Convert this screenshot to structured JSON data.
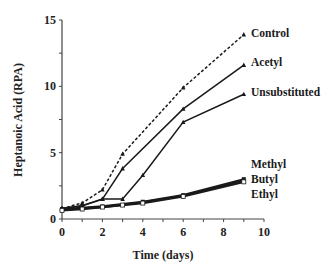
{
  "chart_data": {
    "type": "line",
    "title": "",
    "xlabel": "Time  (days)",
    "ylabel": "Heptanoic Acid (RPA)",
    "xlim": [
      0,
      10
    ],
    "ylim": [
      0,
      15
    ],
    "xticks": [
      0,
      2,
      4,
      6,
      8,
      10
    ],
    "yticks": [
      0,
      5,
      10,
      15
    ],
    "grid": false,
    "legend": "direct labels at line ends (right)",
    "series": [
      {
        "name": "Control",
        "style": "dashed",
        "marker": "triangle",
        "x": [
          0,
          1,
          2,
          3,
          6,
          9
        ],
        "y": [
          0.8,
          1.2,
          2.2,
          4.9,
          9.9,
          13.9
        ]
      },
      {
        "name": "Acetyl",
        "style": "solid",
        "marker": "triangle",
        "x": [
          0,
          1,
          2,
          3,
          6,
          9
        ],
        "y": [
          0.8,
          1.0,
          1.5,
          3.8,
          8.3,
          11.6
        ]
      },
      {
        "name": "Unsubstituted",
        "style": "solid",
        "marker": "triangle",
        "x": [
          0,
          1,
          2,
          3,
          4,
          6,
          9
        ],
        "y": [
          0.8,
          1.0,
          1.5,
          1.5,
          3.3,
          7.3,
          9.4
        ]
      },
      {
        "name": "Methyl",
        "style": "solid",
        "marker": "square",
        "x": [
          0,
          1,
          2,
          4,
          6,
          9
        ],
        "y": [
          0.75,
          0.85,
          0.95,
          1.3,
          1.8,
          3.0
        ]
      },
      {
        "name": "Butyl",
        "style": "solid",
        "marker": "circle",
        "x": [
          0,
          1,
          2,
          4,
          6,
          9
        ],
        "y": [
          0.7,
          0.8,
          0.9,
          1.25,
          1.75,
          2.9
        ]
      },
      {
        "name": "Ethyl",
        "style": "solid",
        "marker": "open-square",
        "x": [
          0,
          1,
          2,
          3,
          4,
          6,
          9
        ],
        "y": [
          0.65,
          0.75,
          0.9,
          1.05,
          1.2,
          1.7,
          2.8
        ]
      }
    ]
  }
}
